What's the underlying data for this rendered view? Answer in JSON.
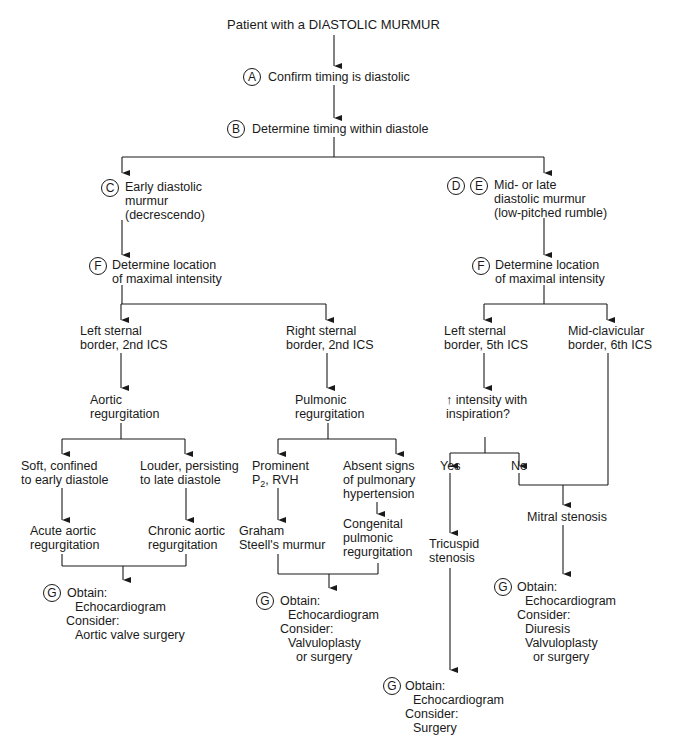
{
  "diagram": {
    "title": "Patient with a DIASTOLIC MURMUR",
    "page_mark": "75",
    "nodes": {
      "A": {
        "badge": "A",
        "text": "Confirm timing is diastolic"
      },
      "B": {
        "badge": "B",
        "text": "Determine timing within diastole"
      },
      "C": {
        "badge": "C",
        "lines": [
          "Early diastolic",
          "murmur",
          "(decrescendo)"
        ]
      },
      "DE": {
        "badges": [
          "D",
          "E"
        ],
        "lines": [
          "Mid- or late",
          "diastolic murmur",
          "(low-pitched rumble)"
        ]
      },
      "F_left": {
        "badge": "F",
        "lines": [
          "Determine location",
          "of maximal intensity"
        ]
      },
      "F_right": {
        "badge": "F",
        "lines": [
          "Determine location",
          "of maximal intensity"
        ]
      },
      "lsb2": {
        "lines": [
          "Left sternal",
          "border, 2nd ICS"
        ]
      },
      "rsb2": {
        "lines": [
          "Right sternal",
          "border, 2nd ICS"
        ]
      },
      "lsb5": {
        "lines": [
          "Left sternal",
          "border, 5th ICS"
        ]
      },
      "mcb6": {
        "lines": [
          "Mid-clavicular",
          "border, 6th ICS"
        ]
      },
      "aortic_reg": {
        "lines": [
          "Aortic",
          "regurgitation"
        ]
      },
      "pulmonic_reg": {
        "lines": [
          "Pulmonic",
          "regurgitation"
        ]
      },
      "inspiration": {
        "arrow": "↑",
        "lines": [
          "intensity with",
          "inspiration?"
        ]
      },
      "soft": {
        "lines": [
          "Soft, confined",
          "to early diastole"
        ]
      },
      "louder": {
        "lines": [
          "Louder, persisting",
          "to late diastole"
        ]
      },
      "prominent": {
        "line1": "Prominent",
        "p": "P",
        "sub": "2",
        "rest": ", RVH"
      },
      "absent": {
        "lines": [
          "Absent signs",
          "of pulmonary",
          "hypertension"
        ]
      },
      "yes": {
        "text": "Yes"
      },
      "no": {
        "text": "No"
      },
      "acute": {
        "lines": [
          "Acute aortic",
          "regurgitation"
        ]
      },
      "chronic": {
        "lines": [
          "Chronic aortic",
          "regurgitation"
        ]
      },
      "graham": {
        "lines": [
          "Graham",
          "Steell's murmur"
        ]
      },
      "congenital": {
        "lines": [
          "Congenital",
          "pulmonic",
          "regurgitation"
        ]
      },
      "tricuspid": {
        "lines": [
          "Tricuspid",
          "stenosis"
        ]
      },
      "mitral": {
        "text": "Mitral stenosis"
      },
      "G1": {
        "badge": "G",
        "obtain": "Obtain:",
        "obtain_items": [
          "Echocardiogram"
        ],
        "consider": "Consider:",
        "consider_items": [
          "Aortic valve surgery"
        ]
      },
      "G2": {
        "badge": "G",
        "obtain": "Obtain:",
        "obtain_items": [
          "Echocardiogram"
        ],
        "consider": "Consider:",
        "consider_items": [
          "Valvuloplasty",
          "or surgery"
        ]
      },
      "G3": {
        "badge": "G",
        "obtain": "Obtain:",
        "obtain_items": [
          "Echocardiogram"
        ],
        "consider": "Consider:",
        "consider_items": [
          "Surgery"
        ]
      },
      "G4": {
        "badge": "G",
        "obtain": "Obtain:",
        "obtain_items": [
          "Echocardiogram"
        ],
        "consider": "Consider:",
        "consider_items": [
          "Diuresis",
          "Valvuloplasty",
          "or surgery"
        ]
      }
    },
    "colors": {
      "line": "#1a1a1a",
      "background": "#ffffff"
    }
  }
}
